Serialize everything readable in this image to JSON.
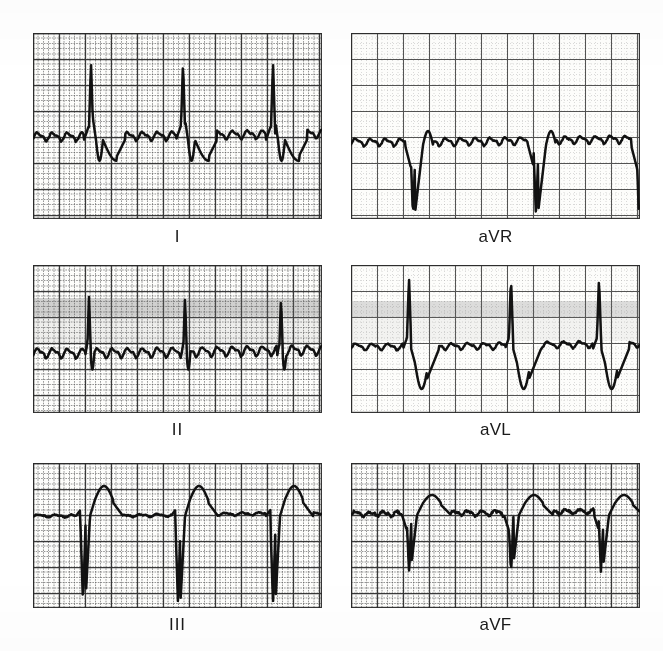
{
  "figure": {
    "kind": "12-lead-ecg-limb-leads",
    "background_color": "#ffffff",
    "grid_fine_color": "#7e7e7e",
    "grid_bold_color": "#2b2b2b",
    "trace_color": "#111111",
    "label_color": "#1a1a1a",
    "paper_speed_note": "",
    "columns": 2,
    "rows": 3
  },
  "panels": [
    {
      "id": "lead-I",
      "label": "I",
      "rect": {
        "x": 33,
        "y": 33,
        "w": 289,
        "h": 186
      },
      "label_pos": {
        "x": 33,
        "y": 228,
        "w": 289
      },
      "grid": {
        "fine": 5.2,
        "bold": 26,
        "density": "dense"
      },
      "smudge": null,
      "baseline": 107,
      "trace": {
        "description": "Atrial flutter with tall narrow R waves, sawtooth flutter waves between beats, deep S and inverted ST-T after each QRS",
        "r_peaks_x": [
          58,
          150,
          240
        ],
        "r_amplitude_px": 78,
        "s_depth_px": 38,
        "flutter_amplitude_px": 9,
        "flutter_period_px": 15
      }
    },
    {
      "id": "lead-aVR",
      "label": "aVR",
      "rect": {
        "x": 351,
        "y": 33,
        "w": 289,
        "h": 186
      },
      "label_pos": {
        "x": 351,
        "y": 228,
        "w": 289
      },
      "grid": {
        "fine": 5.2,
        "bold": 26,
        "density": "light"
      },
      "smudge": null,
      "baseline": 112,
      "trace": {
        "description": "Predominantly negative QRS complexes (deep QS) with flutter waves along the baseline",
        "r_peaks_x": [
          62,
          185,
          288
        ],
        "r_amplitude_px": -6,
        "s_depth_px": 72,
        "flutter_amplitude_px": 8,
        "flutter_period_px": 15
      }
    },
    {
      "id": "lead-II",
      "label": "II",
      "rect": {
        "x": 33,
        "y": 265,
        "w": 289,
        "h": 148
      },
      "label_pos": {
        "x": 33,
        "y": 421,
        "w": 289
      },
      "grid": {
        "fine": 5.2,
        "bold": 26,
        "density": "dense"
      },
      "smudge": {
        "y": 33,
        "h": 18,
        "opacity": 0.3
      },
      "baseline": 92,
      "trace": {
        "description": "Narrow tall spiky R waves with prominent sawtooth flutter waves across the whole baseline",
        "r_peaks_x": [
          56,
          152,
          248
        ],
        "r_amplitude_px": 60,
        "s_depth_px": 14,
        "flutter_amplitude_px": 10,
        "flutter_period_px": 15
      }
    },
    {
      "id": "lead-aVL",
      "label": "aVL",
      "rect": {
        "x": 351,
        "y": 265,
        "w": 289,
        "h": 148
      },
      "label_pos": {
        "x": 351,
        "y": 421,
        "w": 289
      },
      "grid": {
        "fine": 5.2,
        "bold": 26,
        "density": "light"
      },
      "smudge": {
        "y": 36,
        "h": 16,
        "opacity": 0.22
      },
      "baseline": 84,
      "trace": {
        "description": "Tall narrow R waves followed by deep negative S/ST depression troughs",
        "r_peaks_x": [
          58,
          160,
          248
        ],
        "r_amplitude_px": 72,
        "s_depth_px": 40,
        "flutter_amplitude_px": 7,
        "flutter_period_px": 16
      }
    },
    {
      "id": "lead-III",
      "label": "III",
      "rect": {
        "x": 33,
        "y": 463,
        "w": 289,
        "h": 145
      },
      "label_pos": {
        "x": 33,
        "y": 616,
        "w": 289
      },
      "grid": {
        "fine": 5.2,
        "bold": 26,
        "density": "dense"
      },
      "smudge": null,
      "baseline": 53,
      "trace": {
        "description": "Deep QS complexes with tall peaked T waves; flat isoelectric segments between beats",
        "r_peaks_x": [
          50,
          145,
          240
        ],
        "r_amplitude_px": 5,
        "s_depth_px": 88,
        "t_amplitude_px": 30,
        "flutter_amplitude_px": 3,
        "flutter_period_px": 17
      }
    },
    {
      "id": "lead-aVF",
      "label": "aVF",
      "rect": {
        "x": 351,
        "y": 463,
        "w": 289,
        "h": 145
      },
      "label_pos": {
        "x": 351,
        "y": 616,
        "w": 289
      },
      "grid": {
        "fine": 5.2,
        "bold": 26,
        "density": "dense"
      },
      "smudge": null,
      "baseline": 52,
      "trace": {
        "description": "Noisy baseline with negative QS deflections and low rounded T waves",
        "r_peaks_x": [
          58,
          160,
          250
        ],
        "r_amplitude_px": 8,
        "s_depth_px": 58,
        "t_amplitude_px": 20,
        "flutter_amplitude_px": 5,
        "flutter_period_px": 14
      }
    }
  ],
  "chart_data": {
    "type": "line",
    "title": "",
    "xlabel": "",
    "ylabel": "",
    "legend_position": "below-each-panel",
    "grid": true,
    "series": [
      {
        "name": "I",
        "panel": "lead-I",
        "morphology": "tall R, deep S, flutter baseline"
      },
      {
        "name": "aVR",
        "panel": "lead-aVR",
        "morphology": "deep QS, flutter baseline"
      },
      {
        "name": "II",
        "panel": "lead-II",
        "morphology": "spiky R, sawtooth flutter"
      },
      {
        "name": "aVL",
        "panel": "lead-aVL",
        "morphology": "tall R, deep ST trough"
      },
      {
        "name": "III",
        "panel": "lead-III",
        "morphology": "deep QS, tall T"
      },
      {
        "name": "aVF",
        "panel": "lead-aVF",
        "morphology": "QS with noisy low-amplitude baseline"
      }
    ]
  }
}
